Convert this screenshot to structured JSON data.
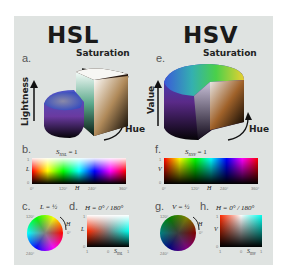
{
  "titles": {
    "hsl": "HSL",
    "hsv": "HSV"
  },
  "panels": {
    "a": {
      "letter": "a.",
      "saturation": "Saturation",
      "axis": "Lightness",
      "hue": "Hue"
    },
    "e": {
      "letter": "e.",
      "saturation": "Saturation",
      "axis": "Value",
      "hue": "Hue"
    },
    "b": {
      "letter": "b.",
      "caption": "S_HSL = 1",
      "caption_main": "S",
      "caption_sub": "HSL",
      "caption_tail": " = 1",
      "yaxis": "L",
      "ytick_top": "1",
      "ytick_bottom": "0",
      "xaxis": "H",
      "xticks": [
        "0°",
        "120°",
        "240°",
        "360°"
      ]
    },
    "f": {
      "letter": "f.",
      "caption_main": "S",
      "caption_sub": "HSV",
      "caption_tail": " = 1",
      "yaxis": "V",
      "ytick_top": "1",
      "ytick_bottom": "0",
      "xaxis": "H",
      "xticks": [
        "0°",
        "120°",
        "240°",
        "360°"
      ]
    },
    "c": {
      "letter": "c.",
      "caption": "L = ½",
      "hue_label": "H",
      "tick_top": "120°",
      "tick_bottom": "240°",
      "tick_right": "0°"
    },
    "d": {
      "letter": "d.",
      "caption": "H = 0° / 180°",
      "yaxis": "L",
      "ytick_top": "1",
      "ytick_bottom": "0",
      "xtick_left": "1",
      "xtick_mid": "0",
      "xtick_right": "1",
      "xaxis_main": "S",
      "xaxis_sub": "HSL"
    },
    "g": {
      "letter": "g.",
      "caption": "V = ½",
      "hue_label": "H",
      "tick_top": "120°",
      "tick_bottom": "240°",
      "tick_right": "0°"
    },
    "h": {
      "letter": "h.",
      "caption": "H = 0° / 180°",
      "yaxis": "V",
      "ytick_top": "1",
      "ytick_bottom": "0",
      "xtick_left": "1",
      "xtick_mid": "0",
      "xtick_right": "1",
      "xaxis_main": "S",
      "xaxis_sub": "HSV"
    }
  },
  "colors": {
    "panel_bg": "#dfe3e1",
    "page_bg": "#ffffff",
    "text": "#1a1a1a"
  }
}
